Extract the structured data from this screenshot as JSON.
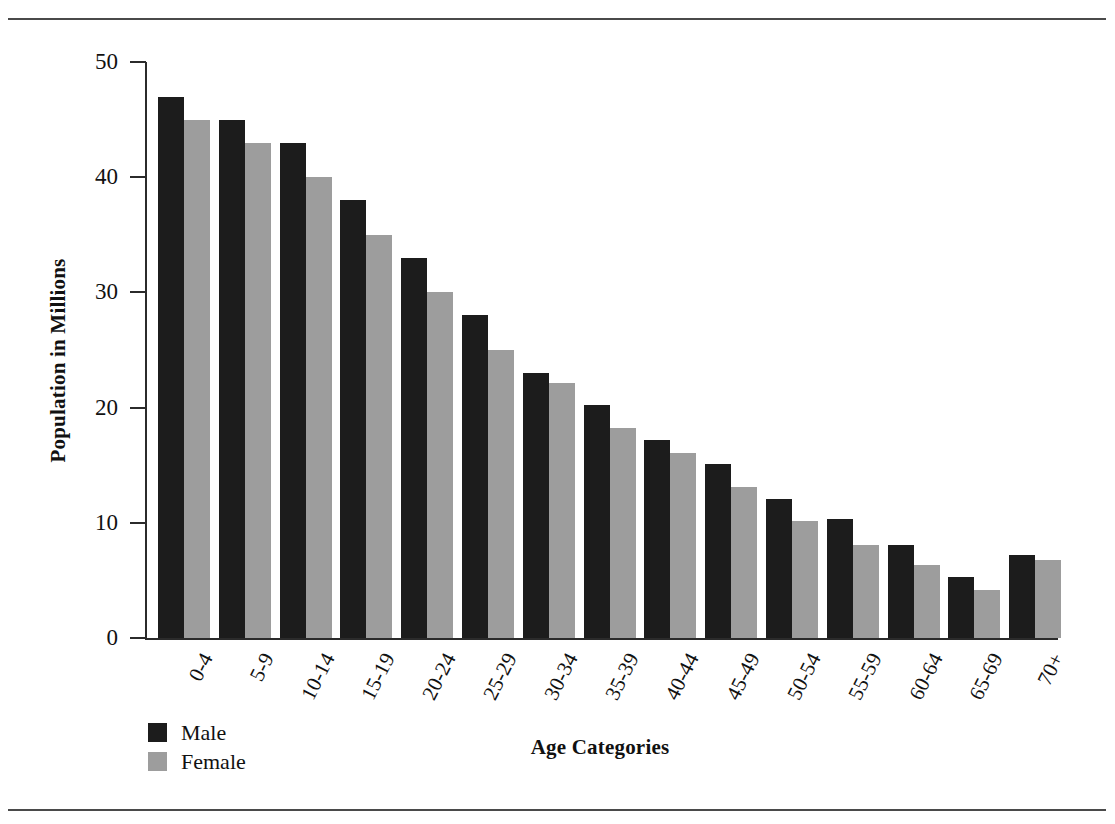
{
  "page": {
    "rules": [
      "top-rule",
      "bottom-rule"
    ]
  },
  "chart_data": {
    "type": "bar",
    "title": "",
    "xlabel": "Age Categories",
    "ylabel": "Population in Millions",
    "ylim": [
      0,
      50
    ],
    "yticks": [
      0,
      10,
      20,
      30,
      40,
      50
    ],
    "ytick_labels": [
      "0",
      "10",
      "20",
      "30",
      "40",
      "50"
    ],
    "grid": false,
    "legend_position": "bottom-left",
    "categories": [
      "0-4",
      "5-9",
      "10-14",
      "15-19",
      "20-24",
      "25-29",
      "30-34",
      "35-39",
      "40-44",
      "45-49",
      "50-54",
      "55-59",
      "60-64",
      "65-69",
      "70+"
    ],
    "series": [
      {
        "name": "Male",
        "color": "#1c1c1c",
        "values": [
          47,
          45,
          43,
          38,
          33,
          28,
          23,
          20.2,
          17.2,
          15.1,
          12.1,
          10.3,
          8.1,
          5.3,
          7.2
        ]
      },
      {
        "name": "Female",
        "color": "#9d9d9d",
        "values": [
          45,
          43,
          40,
          35,
          30,
          25,
          22.1,
          18.2,
          16.1,
          13.1,
          10.2,
          8.1,
          6.3,
          4.2,
          6.8
        ]
      }
    ]
  }
}
